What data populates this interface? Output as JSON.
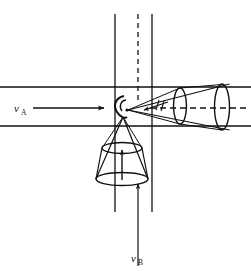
{
  "figure": {
    "background_color": "#ffffff",
    "line_color": "#111111",
    "width": 251,
    "height": 271
  },
  "labels": {
    "beam_a": {
      "symbol": "ν",
      "subscript": "A",
      "x": 14,
      "y": 112
    },
    "beam_b": {
      "symbol": "ν",
      "subscript": "B",
      "x": 136,
      "y": 262
    }
  },
  "beams": {
    "horizontal": {
      "name": "beam-a-band",
      "top_edge_y": 87,
      "bottom_edge_y": 126,
      "x_start": 0,
      "x_end": 251,
      "axis_y": 108,
      "direction": "right"
    },
    "vertical": {
      "name": "beam-b-band",
      "left_edge_x": 115,
      "right_edge_x": 152,
      "y_start": 14,
      "y_end": 212,
      "axis_x": 138,
      "direction": "up"
    }
  },
  "axes": {
    "dashed_vertical": {
      "x": 138,
      "y_start": 14,
      "y_end": 104,
      "dash": "5 4"
    },
    "dashed_horizontal": {
      "y": 108,
      "x_start": 150,
      "x_end": 249,
      "dash": "6 4"
    }
  },
  "arrows": {
    "beam_a_arrow": {
      "x1": 33,
      "y1": 108,
      "x2": 106,
      "y2": 108
    },
    "beam_b_arrow": {
      "x1": 138,
      "y1": 266,
      "x2": 138,
      "y2": 182
    },
    "cone_right_inner_arrow": {
      "x1": 163,
      "y1": 104,
      "x2": 146,
      "y2": 109
    },
    "cone_down_inner_arrow": {
      "x1": 122,
      "y1": 178,
      "x2": 122,
      "y2": 148
    }
  },
  "cones": [
    {
      "name": "right-emission-cone",
      "apex": {
        "x": 128,
        "y": 110
      },
      "axis_angle_deg": -2,
      "cross_sections": [
        {
          "cx": 180,
          "cy": 106,
          "rx": 6.5,
          "ry": 18
        },
        {
          "cx": 222,
          "cy": 107,
          "rx": 7.5,
          "ry": 24
        }
      ]
    },
    {
      "name": "lower-emission-cone",
      "apex": {
        "x": 123,
        "y": 117
      },
      "axis_angle_deg": 92,
      "cross_sections": [
        {
          "cx": 122,
          "cy": 148,
          "rx": 20,
          "ry": 5.5
        },
        {
          "cx": 122,
          "cy": 179,
          "rx": 26,
          "ry": 6.5
        }
      ]
    }
  ],
  "interaction_point": {
    "name": "interaction-vertex",
    "x": 126,
    "y": 110,
    "marker": "hook-arc"
  }
}
